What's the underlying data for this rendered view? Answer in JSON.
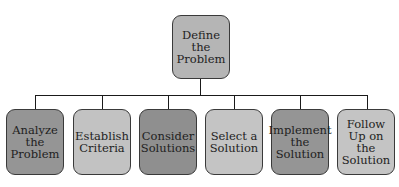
{
  "diagram": {
    "root": {
      "label": "Define the Problem",
      "color": "#b5b5b5"
    },
    "children": [
      {
        "label": "Analyze the Problem",
        "color": "#959595"
      },
      {
        "label": "Establish Criteria",
        "color": "#c2c2c2"
      },
      {
        "label": "Consider Solutions",
        "color": "#8f8f8f"
      },
      {
        "label": "Select a Solution",
        "color": "#c4c4c4"
      },
      {
        "label": "Implement the Solution",
        "color": "#959595"
      },
      {
        "label": "Follow Up on the Solution",
        "color": "#c4c4c4"
      }
    ]
  }
}
